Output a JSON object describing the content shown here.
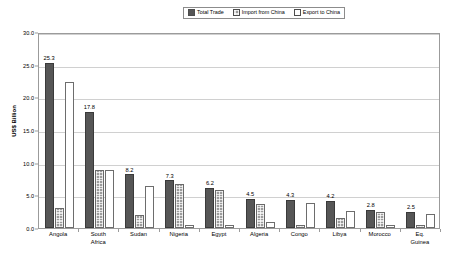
{
  "chart_data": {
    "type": "bar",
    "title": "",
    "xlabel": "",
    "ylabel": "US$ Billion",
    "ylim": [
      0,
      30
    ],
    "ytick_step": 5,
    "ytick_labels": [
      "0.0",
      "5.0",
      "10.0",
      "15.0",
      "20.0",
      "25.0",
      "30.0"
    ],
    "grid": true,
    "legend_position": "top-center",
    "categories": [
      "Angola",
      "South Africa",
      "Sudan",
      "Nigeria",
      "Egypt",
      "Algeria",
      "Congo",
      "Libya",
      "Morocco",
      "Eq. Guinea"
    ],
    "category_lines": [
      [
        "Angola"
      ],
      [
        "South",
        "Africa"
      ],
      [
        "Sudan"
      ],
      [
        "Nigeria"
      ],
      [
        "Egypt"
      ],
      [
        "Algeria"
      ],
      [
        "Congo"
      ],
      [
        "Libya"
      ],
      [
        "Morocco"
      ],
      [
        "Eq.",
        "Guinea"
      ]
    ],
    "series": [
      {
        "name": "Total Trade",
        "color": "#565656",
        "values": [
          25.3,
          17.8,
          8.2,
          7.3,
          6.2,
          4.5,
          4.3,
          4.2,
          2.8,
          2.5
        ],
        "labels": [
          "25.3",
          "17.8",
          "8.2",
          "7.3",
          "6.2",
          "4.5",
          "4.3",
          "4.2",
          "2.8",
          "2.5"
        ]
      },
      {
        "name": "Import from China",
        "color": "#9c9c9c",
        "values": [
          3.0,
          8.9,
          2.0,
          6.8,
          5.8,
          3.6,
          0.5,
          1.6,
          2.4,
          0.4
        ]
      },
      {
        "name": "Export to China",
        "color": "#ffffff",
        "values": [
          22.3,
          8.9,
          6.4,
          0.5,
          0.5,
          0.9,
          3.8,
          2.6,
          0.4,
          2.1
        ]
      }
    ]
  },
  "legend": {
    "items": [
      {
        "label": "Total Trade",
        "swatch": "total-trade-swatch"
      },
      {
        "label": "Import from China",
        "swatch": "import-from-china-swatch"
      },
      {
        "label": "Export to China",
        "swatch": "export-to-china-swatch"
      }
    ]
  },
  "axis": {
    "y_title": "US$ Billion"
  }
}
